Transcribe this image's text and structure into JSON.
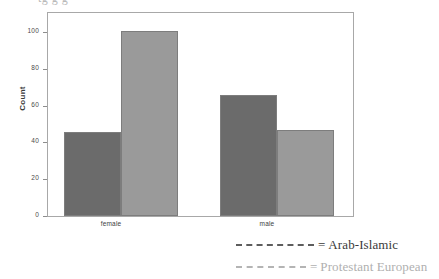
{
  "top_crop": {
    "text": "tg    g   g"
  },
  "chart_data": {
    "type": "bar",
    "title": "",
    "xlabel": "",
    "ylabel": "Count",
    "ylim": [
      0,
      100
    ],
    "yticks": [
      0,
      20,
      40,
      60,
      80,
      100
    ],
    "ytick_labels": [
      "0",
      "20",
      "40",
      "60",
      "80",
      "100"
    ],
    "grid": false,
    "legend_position": "below-right",
    "categories": [
      "female",
      "male"
    ],
    "series": [
      {
        "name": "Arab-Islamic",
        "color": "#6b6b6b",
        "values": [
          42,
          61
        ]
      },
      {
        "name": "Protestant European",
        "color": "#9a9a9a",
        "values": [
          93,
          43
        ]
      }
    ]
  },
  "axis": {
    "y_label": "Count",
    "y_tick_0": "0",
    "y_tick_20": "20",
    "y_tick_40": "40",
    "y_tick_60": "60",
    "y_tick_80": "80",
    "y_tick_100": "100",
    "x_label_female": "female",
    "x_label_male": "male"
  },
  "legend": {
    "equals": "=",
    "items": [
      {
        "label": "Arab-Islamic",
        "color": "#555555"
      },
      {
        "label": "Protestant European",
        "color": "#b0b0b0"
      }
    ]
  }
}
